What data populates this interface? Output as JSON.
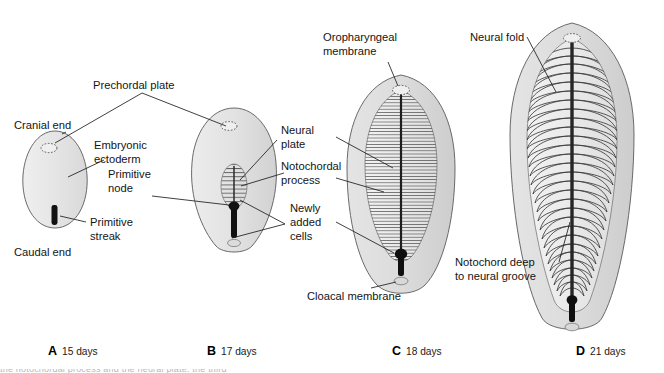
{
  "figure": {
    "type": "biomedical-illustration",
    "background_color": "#ffffff",
    "fill_light": "#e9e9e9",
    "fill_mid": "#d6d6d6",
    "fill_dark": "#c4c4c4",
    "line_color": "#1d1d1d",
    "accent_black": "#101010"
  },
  "labels": {
    "prechordal_plate": "Prechordal plate",
    "cranial_end": "Cranial end",
    "embryonic_ectoderm_line1": "Embryonic",
    "embryonic_ectoderm_line2": "ectoderm",
    "primitive_streak_line1": "Primitive",
    "primitive_streak_line2": "streak",
    "caudal_end": "Caudal end",
    "primitive_node_line1": "Primitive",
    "primitive_node_line2": "node",
    "neural_plate_line1": "Neural",
    "neural_plate_line2": "plate",
    "notochordal_process_line1": "Notochordal",
    "notochordal_process_line2": "process",
    "newly_added_cells_line1": "Newly",
    "newly_added_cells_line2": "added",
    "newly_added_cells_line3": "cells",
    "oropharyngeal_membrane_line1": "Oropharyngeal",
    "oropharyngeal_membrane_line2": "membrane",
    "cloacal_membrane": "Cloacal membrane",
    "neural_fold": "Neural fold",
    "notochord_deep_line1": "Notochord deep",
    "notochord_deep_line2": "to neural groove"
  },
  "panels": [
    {
      "letter": "A",
      "days": "15 days"
    },
    {
      "letter": "B",
      "days": "17 days"
    },
    {
      "letter": "C",
      "days": "18 days"
    },
    {
      "letter": "D",
      "days": "21 days"
    }
  ],
  "footer": {
    "cropped_caption": "the notochordal process and the neural plate. the third"
  }
}
